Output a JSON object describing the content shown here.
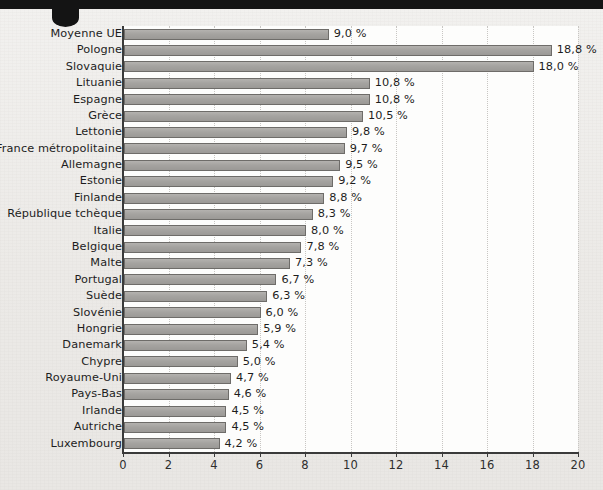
{
  "chart_data": {
    "type": "bar",
    "orientation": "horizontal",
    "title": "",
    "subtitle": "",
    "xlabel": "",
    "ylabel": "",
    "xlim": [
      0,
      20
    ],
    "xticks": [
      0,
      2,
      4,
      6,
      8,
      10,
      12,
      14,
      16,
      18,
      20
    ],
    "xtick_labels": [
      "0",
      "2",
      "4",
      "6",
      "8",
      "10",
      "12",
      "14",
      "16",
      "18",
      "20"
    ],
    "grid": "vertical-dotted",
    "legend": "none",
    "value_suffix": " %",
    "decimal_separator": ",",
    "categories": [
      "Moyenne UE",
      "Pologne",
      "Slovaquie",
      "Lituanie",
      "Espagne",
      "Grèce",
      "Lettonie",
      "France métropolitaine",
      "Allemagne",
      "Estonie",
      "Finlande",
      "République tchèque",
      "Italie",
      "Belgique",
      "Malte",
      "Portugal",
      "Suède",
      "Slovénie",
      "Hongrie",
      "Danemark",
      "Chypre",
      "Royaume-Uni",
      "Pays-Bas",
      "Irlande",
      "Autriche",
      "Luxembourg"
    ],
    "values": [
      9.0,
      18.8,
      18.0,
      10.8,
      10.8,
      10.5,
      9.8,
      9.7,
      9.5,
      9.2,
      8.8,
      8.3,
      8.0,
      7.8,
      7.3,
      6.7,
      6.3,
      6.0,
      5.9,
      5.4,
      5.0,
      4.7,
      4.6,
      4.5,
      4.5,
      4.2
    ],
    "data_labels": [
      "9,0 %",
      "18,8 %",
      "18,0 %",
      "10,8 %",
      "10,8 %",
      "10,5 %",
      "9,8 %",
      "9,7 %",
      "9,5 %",
      "9,2 %",
      "8,8 %",
      "8,3 %",
      "8,0 %",
      "7,8 %",
      "7,3 %",
      "6,7 %",
      "6,3 %",
      "6,0 %",
      "5,9 %",
      "5,4 %",
      "5,0 %",
      "4,7 %",
      "4,6 %",
      "4,5 %",
      "4,5 %",
      "4,2 %"
    ],
    "colors": {
      "bar_fill": "#a5a3a0",
      "bar_edge": "#6e6c69",
      "plot_bg": "#fdfdfc",
      "page_bg": "#eceae7",
      "axis": "#3a3a3a",
      "grid": "#c8c6c3",
      "text": "#1d1d1d",
      "band": "#141414"
    }
  },
  "decor": {
    "top_band_name": "top-black-band",
    "notch_name": "page-tab-notch"
  }
}
